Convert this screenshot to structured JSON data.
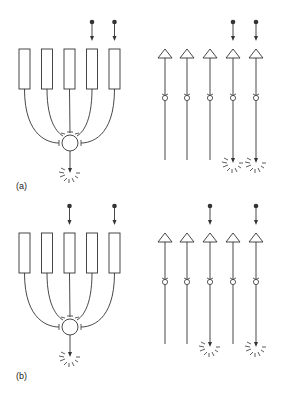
{
  "panels": [
    {
      "label": "(a)",
      "label_pos": {
        "x": 16,
        "y": 181
      },
      "y_offset": 0,
      "active_inputs": [
        3,
        4
      ],
      "left_fires": true,
      "right_firing": [
        3,
        4
      ]
    },
    {
      "label": "(b)",
      "label_pos": {
        "x": 16,
        "y": 371
      },
      "y_offset": 184,
      "active_inputs": [
        2,
        4
      ],
      "left_fires": true,
      "right_firing": [
        2,
        4
      ]
    }
  ],
  "layout": {
    "left_columns_x": [
      24.5,
      47,
      69.5,
      92,
      114.5
    ],
    "rect_width": 11,
    "rect_top": 49,
    "rect_bottom": 89,
    "soma": {
      "cx": 70,
      "cy": 143,
      "r": 8
    },
    "right_columns_x": [
      165,
      187,
      210,
      233,
      256
    ],
    "triangle_top": 49,
    "triangle_base": 58,
    "triangle_half": 7,
    "synapse_y": 98,
    "line_end": 160,
    "fire_arrow_end": 163,
    "input_dot_y": 22,
    "input_arrow_end": 41
  },
  "colors": {
    "stroke": "#333333",
    "background": "#ffffff"
  },
  "icons": {
    "input-spike": "filled dot with down arrow",
    "output-spike": "arrow with radiating rays",
    "neuron-soma": "circle",
    "dendrite-branch": "rectangle",
    "neuron-triangle": "triangle",
    "synapse": "small circle with cup"
  }
}
